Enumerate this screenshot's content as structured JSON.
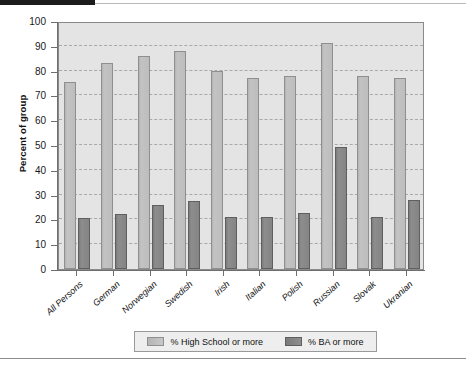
{
  "chart_data": {
    "type": "bar",
    "title": "",
    "xlabel": "",
    "ylabel": "Percent of group",
    "ylim": [
      0,
      100
    ],
    "ytick_step": 10,
    "grid": true,
    "legend_position": "bottom",
    "categories": [
      "All Persons",
      "German",
      "Norwegian",
      "Swedish",
      "Irish",
      "Italian",
      "Polish",
      "Russian",
      "Slovak",
      "Ukranian"
    ],
    "yticks": [
      "0",
      "10",
      "20",
      "30",
      "40",
      "50",
      "60",
      "70",
      "80",
      "90",
      "100"
    ],
    "series": [
      {
        "name": "% High School or more",
        "color": "#bdbdbd",
        "values": [
          75.5,
          83,
          86,
          88,
          80,
          77,
          78,
          91,
          78,
          77
        ]
      },
      {
        "name": "% BA or more",
        "color": "#848484",
        "values": [
          20.5,
          22,
          26,
          27.5,
          21,
          21,
          22.5,
          49,
          21,
          28
        ]
      }
    ]
  },
  "colors": {
    "plot_background": "#e4e4e4",
    "axis": "#6e6e6e",
    "gridline": "#a9a9a9",
    "series_high_school": "#bdbdbd",
    "series_ba": "#848484",
    "legend_background": "#eeeeee",
    "text": "#111111"
  }
}
